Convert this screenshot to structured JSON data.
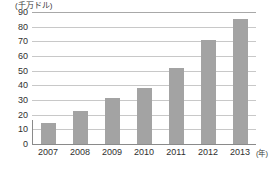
{
  "chart_data": {
    "type": "bar",
    "title": "",
    "subtitle": "",
    "xlabel": "(年)",
    "ylabel": "(千万ドル)",
    "categories": [
      "2007",
      "2008",
      "2009",
      "2010",
      "2011",
      "2012",
      "2013"
    ],
    "values": [
      14,
      22.5,
      31.5,
      38.5,
      52,
      71,
      85
    ],
    "series": [
      {
        "name": "",
        "values": [
          14,
          22.5,
          31.5,
          38.5,
          52,
          71,
          85
        ]
      }
    ],
    "ylim": [
      0,
      90
    ],
    "ytick_step": 10,
    "ytick_labels": [
      "90",
      "80",
      "70",
      "60",
      "50",
      "40",
      "30",
      "20",
      "10",
      "0"
    ],
    "grid": true,
    "legend": "none",
    "bar_color": "#a3a3a3",
    "grid_color": "#c8c8c8",
    "axis_color": "#8a8a8a",
    "background": "#ffffff",
    "text_color": "#2f2f2f"
  },
  "axis": {
    "y_unit_caption": "(千万ドル)",
    "x_unit_caption": "(年)"
  }
}
